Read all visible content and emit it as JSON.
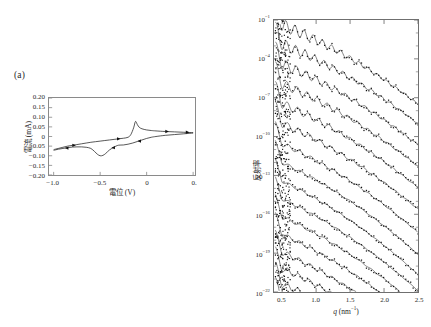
{
  "figure": {
    "panel_a_tag": "(a)",
    "panel_b_tag": "(b)"
  },
  "chart_data": [
    {
      "type": "line",
      "panel": "(a)",
      "title": "",
      "xlabel": "電位 (V)",
      "ylabel": "電流 (mA)",
      "xlim": [
        -1.05,
        0.52
      ],
      "ylim": [
        -0.2,
        0.2
      ],
      "xticks": [
        -1.0,
        -0.5,
        0.0,
        0.5
      ],
      "xticklabels": [
        "−1.0",
        "−0.5",
        "0",
        "0."
      ],
      "yticks": [
        0.2,
        0.15,
        0.1,
        0.05,
        0.0,
        -0.05,
        -0.1,
        -0.15,
        -0.2
      ],
      "yticklabels": [
        "0.20",
        "0.15",
        "0.10",
        "0.05",
        "0",
        "−0.05",
        "−0.10",
        "−0.15",
        "−0.20"
      ],
      "grid": false,
      "legend": "none",
      "description": "Cyclic voltammogram with arrows marking the scan direction",
      "series": [
        {
          "name": "forward_scan_anodic",
          "comment": "negative to positive sweep",
          "x": [
            -1.0,
            -0.95,
            -0.9,
            -0.85,
            -0.8,
            -0.75,
            -0.7,
            -0.65,
            -0.6,
            -0.55,
            -0.5,
            -0.45,
            -0.4,
            -0.35,
            -0.3,
            -0.25,
            -0.2,
            -0.17,
            -0.14,
            -0.12,
            -0.1,
            -0.08,
            -0.05,
            0.0,
            0.05,
            0.1,
            0.2,
            0.3,
            0.4,
            0.5
          ],
          "y": [
            -0.068,
            -0.062,
            -0.056,
            -0.05,
            -0.046,
            -0.042,
            -0.038,
            -0.034,
            -0.03,
            -0.027,
            -0.024,
            -0.021,
            -0.018,
            -0.015,
            -0.012,
            -0.009,
            -0.004,
            0.01,
            0.045,
            0.078,
            0.062,
            0.048,
            0.04,
            0.034,
            0.031,
            0.029,
            0.026,
            0.024,
            0.022,
            0.02
          ]
        },
        {
          "name": "reverse_scan_cathodic",
          "comment": "positive to negative sweep",
          "x": [
            0.5,
            0.4,
            0.3,
            0.2,
            0.1,
            0.05,
            0.0,
            -0.05,
            -0.1,
            -0.15,
            -0.2,
            -0.25,
            -0.3,
            -0.33,
            -0.36,
            -0.4,
            -0.44,
            -0.47,
            -0.5,
            -0.53,
            -0.56,
            -0.6,
            -0.65,
            -0.7,
            -0.75,
            -0.8,
            -0.85,
            -0.9,
            -0.95,
            -1.0
          ],
          "y": [
            0.018,
            0.014,
            0.01,
            0.006,
            0.0,
            -0.004,
            -0.01,
            -0.018,
            -0.026,
            -0.034,
            -0.04,
            -0.044,
            -0.045,
            -0.05,
            -0.058,
            -0.07,
            -0.088,
            -0.098,
            -0.1,
            -0.092,
            -0.078,
            -0.062,
            -0.056,
            -0.054,
            -0.054,
            -0.055,
            -0.058,
            -0.062,
            -0.066,
            -0.072
          ]
        }
      ]
    },
    {
      "type": "line",
      "panel": "(b)",
      "title": "",
      "xlabel": "q (nm⁻¹)",
      "ylabel": "反射率",
      "xlim": [
        0.38,
        2.5
      ],
      "ylim_log": [
        -22,
        -1
      ],
      "xticks": [
        0.5,
        1.0,
        1.5,
        2.0,
        2.5
      ],
      "xticklabels": [
        "0.5",
        "1.0",
        "1.5",
        "2.0",
        "2.5"
      ],
      "yticklabels": [
        "10⁻¹",
        "10⁻⁴",
        "10⁻⁷",
        "10⁻¹⁰",
        "10⁻¹³",
        "10⁻¹⁶",
        "10⁻¹⁹",
        "10⁻²²"
      ],
      "yticks_exponent": [
        -1,
        -4,
        -7,
        -10,
        -13,
        -16,
        -19,
        -22
      ],
      "yscale": "log",
      "grid": false,
      "legend": "right-inline-annotations",
      "description": "X-ray reflectivity curves vertically offset by decades, each annotated with its applied electrode potential",
      "curves": [
        {
          "label": "−0.12 V",
          "offset_decade": 0.0,
          "oscillation_amplitude": 0.55,
          "period": 0.135,
          "decay": 1.0
        },
        {
          "label": "−0.80 V",
          "offset_decade": -1.5,
          "oscillation_amplitude": 0.5,
          "period": 0.14,
          "decay": 1.0
        },
        {
          "label": "−0.40 V",
          "offset_decade": -3.0,
          "oscillation_amplitude": 0.46,
          "period": 0.145,
          "decay": 1.02
        },
        {
          "label": "−0.80 V",
          "offset_decade": -4.5,
          "oscillation_amplitude": 0.42,
          "period": 0.15,
          "decay": 1.04
        },
        {
          "label": "−0.60 V",
          "offset_decade": -6.0,
          "oscillation_amplitude": 0.38,
          "period": 0.155,
          "decay": 1.06
        },
        {
          "label": "−0.40 V",
          "offset_decade": -7.5,
          "oscillation_amplitude": 0.32,
          "period": 0.16,
          "decay": 1.08
        },
        {
          "label": "−0.20 V",
          "offset_decade": -9.0,
          "oscillation_amplitude": 0.22,
          "period": 0.17,
          "decay": 1.12
        },
        {
          "label": "0.00 V",
          "offset_decade": -10.4,
          "oscillation_amplitude": 0.14,
          "period": 0.18,
          "decay": 1.16
        },
        {
          "label": "0.20 V",
          "offset_decade": -11.8,
          "oscillation_amplitude": 0.12,
          "period": 0.185,
          "decay": 1.18
        },
        {
          "label": "0.40 V",
          "offset_decade": -13.2,
          "oscillation_amplitude": 0.13,
          "period": 0.18,
          "decay": 1.16
        },
        {
          "label": "0.20 V",
          "offset_decade": -14.6,
          "oscillation_amplitude": 0.16,
          "period": 0.175,
          "decay": 1.14
        },
        {
          "label": "0.00 V",
          "offset_decade": -16.0,
          "oscillation_amplitude": 0.2,
          "period": 0.17,
          "decay": 1.12
        },
        {
          "label": "−0.20 V",
          "offset_decade": -17.4,
          "oscillation_amplitude": 0.24,
          "period": 0.165,
          "decay": 1.1
        },
        {
          "label": "−0.40 V",
          "offset_decade": -18.7,
          "oscillation_amplitude": 0.28,
          "period": 0.16,
          "decay": 1.08
        },
        {
          "label": "−0.60 V",
          "offset_decade": -19.9,
          "oscillation_amplitude": 0.32,
          "period": 0.155,
          "decay": 1.06
        },
        {
          "label": "−0.80 V",
          "offset_decade": -21.1,
          "oscillation_amplitude": 0.34,
          "period": 0.15,
          "decay": 1.05
        }
      ]
    }
  ]
}
